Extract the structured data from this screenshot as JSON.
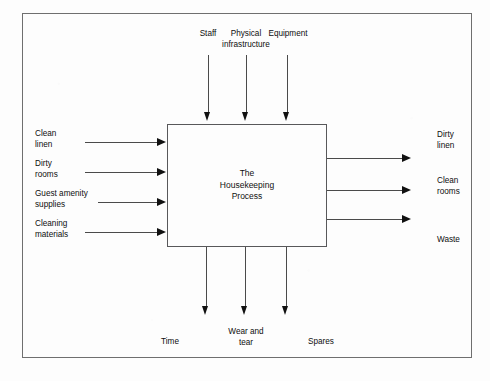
{
  "diagram": {
    "title": "The Housekeeping Process",
    "type": "IDEF0 process box (inputs, controls, outputs, mechanisms)",
    "process_label": "The\nHousekeeping\nProcess",
    "colors": {
      "page_background": "#fdfdfd",
      "frame_border": "#6f6f6f",
      "box_border": "#58585a",
      "line": "#4a4a4a",
      "arrow_head": "#111111",
      "text": "#0d0d0d"
    },
    "top_inputs": [
      {
        "label": "Staff"
      },
      {
        "label": "Physical\ninfrastructure"
      },
      {
        "label": "Equipment"
      }
    ],
    "left_inputs": [
      {
        "label": "Clean\nlinen"
      },
      {
        "label": "Dirty\nrooms"
      },
      {
        "label": "Guest amenity\nsupplies"
      },
      {
        "label": "Cleaning\nmaterials"
      }
    ],
    "right_outputs": [
      {
        "label": "Dirty\nlinen"
      },
      {
        "label": "Clean\nrooms"
      },
      {
        "label": "Waste"
      }
    ],
    "bottom_outputs": [
      {
        "label": "Time"
      },
      {
        "label": "Wear and\ntear"
      },
      {
        "label": "Spares"
      }
    ]
  }
}
